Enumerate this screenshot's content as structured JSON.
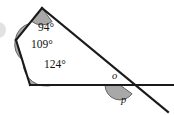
{
  "figure": {
    "background_color": "#ffffff",
    "line_color": "#1a1a1a",
    "arc_fill_color": "#a8a8a8",
    "arc_stroke_color": "#4a4a4a",
    "text_color": "#111111"
  },
  "angle_labels": [
    {
      "id": "angle-94",
      "text": "94°",
      "value": 94,
      "unit": "degrees",
      "style": "upright"
    },
    {
      "id": "angle-109",
      "text": "109°",
      "value": 109,
      "unit": "degrees",
      "style": "upright"
    },
    {
      "id": "angle-124",
      "text": "124°",
      "value": 124,
      "unit": "degrees",
      "style": "upright"
    }
  ],
  "vertex_labels": [
    {
      "id": "label-o",
      "text": "o",
      "style": "italic",
      "position": "above-horizontal-left-of-transversal"
    },
    {
      "id": "label-p",
      "text": "p",
      "style": "italic",
      "position": "below-horizontal-shaded"
    }
  ],
  "geometry": {
    "vertices": {
      "top": {
        "x": 42,
        "y": 8
      },
      "upper_left": {
        "x": 16,
        "y": 40
      },
      "bottom_left": {
        "x": 30,
        "y": 85
      },
      "intersection": {
        "x": 120,
        "y": 85
      }
    },
    "segments": [
      {
        "name": "top-to-upper-left",
        "from": "top",
        "to": "upper_left"
      },
      {
        "name": "upper-left-to-bottom-left",
        "from": "upper_left",
        "to": "bottom_left"
      },
      {
        "name": "horizontal-base-line",
        "from": "bottom_left",
        "to": "right-edge"
      },
      {
        "name": "transversal",
        "from": "top",
        "to": "lower-right-edge"
      }
    ],
    "horizontal_line": {
      "y": 85,
      "x_start": 30,
      "x_end": 174
    },
    "transversal_line": {
      "x1": 42,
      "y1": 8,
      "x2": 168,
      "y2": 112
    }
  }
}
